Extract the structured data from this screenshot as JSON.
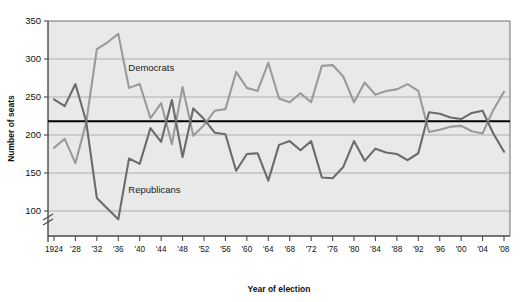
{
  "chart_data": {
    "type": "line",
    "title": "",
    "xlabel": "Year of election",
    "ylabel": "Number of seats",
    "ylim": [
      75,
      350
    ],
    "y_ticks": [
      100,
      150,
      200,
      250,
      300,
      350
    ],
    "y_tick_labels": [
      "100",
      "150",
      "200",
      "250",
      "300",
      "350"
    ],
    "grid": "horizontal",
    "axis_break": true,
    "legend_position": "inline-annotations",
    "annotations": [
      {
        "text": "Democrats",
        "x": 1936,
        "y": 288
      },
      {
        "text": "Republicans",
        "x": 1936,
        "y": 128
      }
    ],
    "reference_line": {
      "value": 218,
      "label": "",
      "color": "#000000"
    },
    "x": [
      1924,
      1926,
      1928,
      1930,
      1932,
      1934,
      1936,
      1938,
      1940,
      1942,
      1944,
      1946,
      1948,
      1950,
      1952,
      1954,
      1956,
      1958,
      1960,
      1962,
      1964,
      1966,
      1968,
      1970,
      1972,
      1974,
      1976,
      1978,
      1980,
      1982,
      1984,
      1986,
      1988,
      1990,
      1992,
      1994,
      1996,
      1998,
      2000,
      2002,
      2004,
      2006,
      2008
    ],
    "x_tick_labels": [
      "1924",
      "",
      "'28",
      "",
      "'32",
      "",
      "'36",
      "",
      "'40",
      "",
      "'44",
      "",
      "'48",
      "",
      "'52",
      "",
      "'56",
      "",
      "'60",
      "",
      "'64",
      "",
      "'68",
      "",
      "'72",
      "",
      "'76",
      "",
      "'80",
      "",
      "'84",
      "",
      "'88",
      "",
      "'92",
      "",
      "'96",
      "",
      "'00",
      "",
      "'04",
      "",
      "'08"
    ],
    "x_major_labels": [
      "1924",
      "'28",
      "'32",
      "'36",
      "'40",
      "'44",
      "'48",
      "'52",
      "'56",
      "'60",
      "'64",
      "'68",
      "'72",
      "'76",
      "'80",
      "'84",
      "'88",
      "'92",
      "'96",
      "'00",
      "'04",
      "'08"
    ],
    "series": [
      {
        "name": "Democrats",
        "color": "#9a9a9a",
        "values": [
          183,
          195,
          163,
          216,
          313,
          322,
          333,
          262,
          267,
          222,
          242,
          188,
          263,
          199,
          213,
          232,
          234,
          283,
          262,
          258,
          295,
          248,
          243,
          255,
          243,
          291,
          292,
          277,
          243,
          269,
          253,
          258,
          260,
          267,
          258,
          204,
          207,
          211,
          212,
          205,
          202,
          233,
          257
        ]
      },
      {
        "name": "Republicans",
        "color": "#6b6b6b",
        "values": [
          247,
          238,
          267,
          218,
          117,
          103,
          89,
          169,
          162,
          209,
          191,
          246,
          171,
          235,
          221,
          203,
          201,
          153,
          175,
          176,
          140,
          187,
          192,
          180,
          192,
          144,
          143,
          158,
          192,
          166,
          182,
          177,
          175,
          167,
          176,
          230,
          228,
          223,
          221,
          229,
          232,
          202,
          178
        ]
      }
    ]
  },
  "axes": {
    "y_axis_title": "Number of seats",
    "x_axis_title": "Year of election"
  }
}
